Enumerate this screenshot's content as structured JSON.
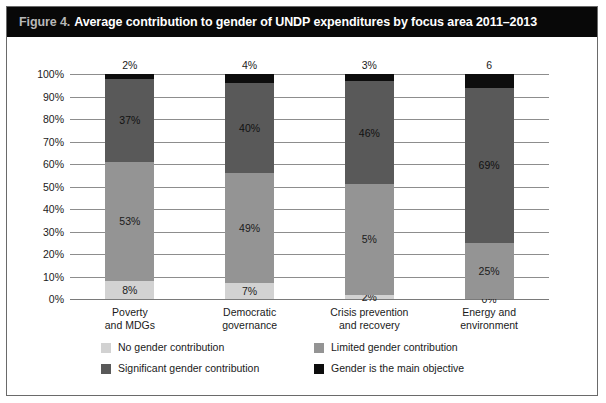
{
  "figure": {
    "number_label": "Figure 4.",
    "title": "Average contribution to gender of UNDP expenditures by focus area 2011–2013"
  },
  "chart_data": {
    "type": "bar",
    "stacked": true,
    "title": "Average contribution to gender of UNDP expenditures by focus area 2011–2013",
    "xlabel": "",
    "ylabel": "",
    "ylim": [
      0,
      100
    ],
    "grid": true,
    "legend_position": "bottom",
    "categories": [
      "Poverty\nand MDGs",
      "Democratic\ngovernance",
      "Crisis prevention\nand recovery",
      "Energy and\nenvironment"
    ],
    "category_lines": [
      [
        "Poverty",
        "and MDGs"
      ],
      [
        "Democratic",
        "governance"
      ],
      [
        "Crisis prevention",
        "and recovery"
      ],
      [
        "Energy and",
        "environment"
      ]
    ],
    "ytick_labels": [
      "100%",
      "90%",
      "80%",
      "70%",
      "60%",
      "50%",
      "40%",
      "30%",
      "20%",
      "10%",
      "0%"
    ],
    "ytick_values": [
      100,
      90,
      80,
      70,
      60,
      50,
      40,
      30,
      20,
      10,
      0
    ],
    "series": [
      {
        "name": "No gender contribution",
        "color": "#d2d2d2",
        "values": [
          8,
          7,
          2,
          0
        ],
        "labels": [
          "8%",
          "7%",
          "2%",
          "0%"
        ]
      },
      {
        "name": "Limited gender contribution",
        "color": "#949494",
        "values": [
          53,
          49,
          49,
          25
        ],
        "labels": [
          "53%",
          "49%",
          "5%",
          "25%"
        ]
      },
      {
        "name": "Significant gender contribution",
        "color": "#595959",
        "values": [
          37,
          40,
          46,
          69
        ],
        "labels": [
          "37%",
          "40%",
          "46%",
          "69%"
        ]
      },
      {
        "name": "Gender is the main objective",
        "color": "#0d0d0d",
        "values": [
          2,
          4,
          3,
          6
        ],
        "labels": [
          "2%",
          "4%",
          "3%",
          "6"
        ]
      }
    ],
    "top_labels": [
      "2%",
      "4%",
      "3%",
      "6"
    ]
  },
  "legend": {
    "items": [
      {
        "label": "No gender contribution",
        "color": "#d2d2d2"
      },
      {
        "label": "Limited gender contribution",
        "color": "#949494"
      },
      {
        "label": "Significant gender contribution",
        "color": "#595959"
      },
      {
        "label": "Gender is the main objective",
        "color": "#0d0d0d"
      }
    ]
  },
  "colors": {
    "title_bar_bg": "#080808",
    "title_num_text": "#b8b8b8",
    "title_text": "#ffffff",
    "frame_border": "#6a6a6a",
    "gridline": "#8d8d8d",
    "axis": "#7a7a7a",
    "text": "#1a1a1a",
    "background": "#ffffff"
  }
}
